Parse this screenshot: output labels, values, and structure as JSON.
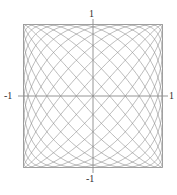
{
  "figure": {
    "title": "",
    "background_color": "#ffffff",
    "width": 177,
    "height": 195
  },
  "axes": {
    "x_axis_label": "",
    "y_axis_label": "",
    "axis_color": "#808080",
    "curve_color": "#8c8c8c",
    "border_color": "#999999",
    "tick_labels": {
      "top": "1",
      "bottom": "-1",
      "left": "-1",
      "right": "1"
    }
  },
  "chart_data": {
    "type": "line",
    "title": "",
    "xlabel": "",
    "ylabel": "",
    "xlim": [
      -1,
      1
    ],
    "ylim": [
      -1,
      1
    ],
    "grid": false,
    "legend": null,
    "parametric": {
      "x_expression": "sin(12*t)",
      "y_expression": "sin(13*t)",
      "frequency_ratio": "12:13",
      "phase": 0,
      "t_range": [
        0,
        6.283185307179586
      ],
      "samples": 4000
    },
    "x_ticks": [
      -1,
      1
    ],
    "y_ticks": [
      -1,
      1
    ],
    "x_tick_labels": [
      "-1",
      "1"
    ],
    "y_tick_labels": [
      "-1",
      "1"
    ],
    "series": [
      {
        "name": "lissajous",
        "color": "#8c8c8c",
        "line_width": 0.6
      }
    ]
  }
}
